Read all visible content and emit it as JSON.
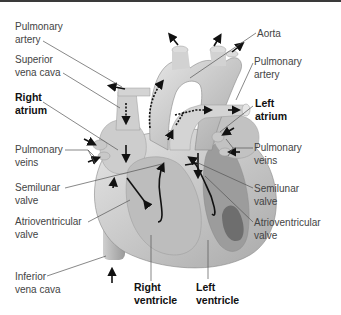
{
  "diagram": {
    "labels": {
      "pulmonary_artery_left": [
        "Pulmonary",
        "artery"
      ],
      "superior_vena_cava": [
        "Superior",
        "vena cava"
      ],
      "right_atrium": [
        "Right",
        "atrium"
      ],
      "pulmonary_veins_left": [
        "Pulmonary",
        "veins"
      ],
      "semilunar_valve_left": [
        "Semilunar",
        "valve"
      ],
      "atrioventricular_valve_left": [
        "Atrioventricular",
        "valve"
      ],
      "inferior_vena_cava": [
        "Inferior",
        "vena cava"
      ],
      "right_ventricle": [
        "Right",
        "ventricle"
      ],
      "left_ventricle": [
        "Left",
        "ventricle"
      ],
      "aorta": [
        "Aorta"
      ],
      "pulmonary_artery_right": [
        "Pulmonary",
        "artery"
      ],
      "left_atrium": [
        "Left",
        "atrium"
      ],
      "pulmonary_veins_right": [
        "Pulmonary",
        "veins"
      ],
      "semilunar_valve_right": [
        "Semilunar",
        "valve"
      ],
      "atrioventricular_valve_right": [
        "Atrioventricular",
        "valve"
      ]
    },
    "colors": {
      "heart_light": "#d9d9d9",
      "heart_mid": "#b8b8b8",
      "heart_dark": "#8a8a8a",
      "chamber_dark": "#6e6e6e",
      "arrow": "#111111",
      "leader": "#555555"
    }
  }
}
